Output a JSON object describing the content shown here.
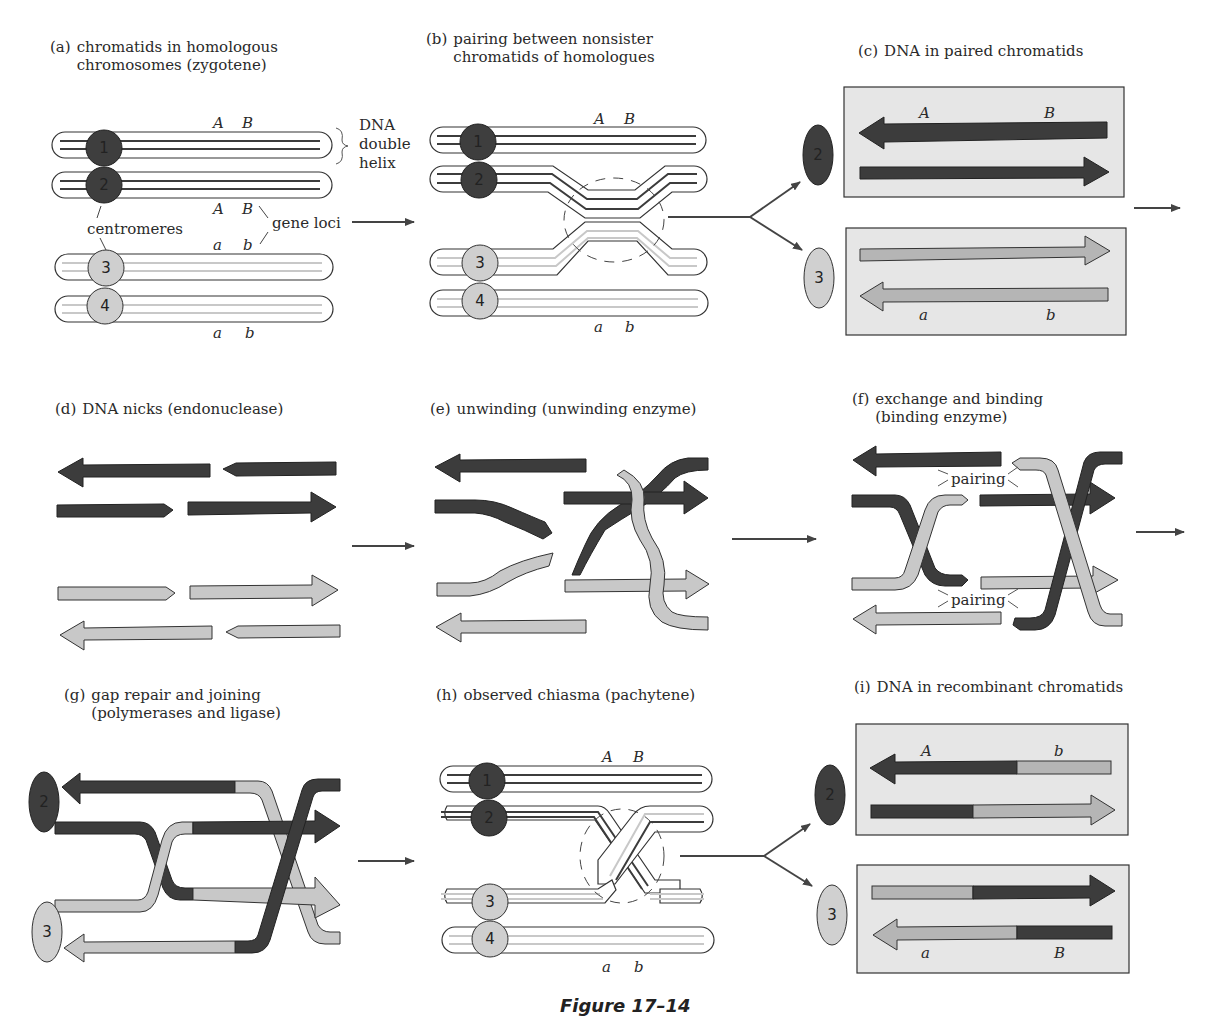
{
  "figure": {
    "title": "Figure 17–14",
    "colors": {
      "dark_strand": "#3c3c3c",
      "light_strand": "#c8c8c8",
      "box_fill": "#e6e6e6",
      "outline": "#333333"
    }
  },
  "panels": [
    {
      "id": "a",
      "tag": "(a)",
      "caption": "chromatids in homologous\nchromosomes (zygotene)"
    },
    {
      "id": "b",
      "tag": "(b)",
      "caption": "pairing between nonsister\nchromatids of homologues"
    },
    {
      "id": "c",
      "tag": "(c)",
      "caption": "DNA in paired chromatids"
    },
    {
      "id": "d",
      "tag": "(d)",
      "caption": "DNA nicks (endonuclease)"
    },
    {
      "id": "e",
      "tag": "(e)",
      "caption": "unwinding (unwinding enzyme)"
    },
    {
      "id": "f",
      "tag": "(f)",
      "caption": "exchange and binding\n(binding enzyme)"
    },
    {
      "id": "g",
      "tag": "(g)",
      "caption": "gap repair and joining\n(polymerases and ligase)"
    },
    {
      "id": "h",
      "tag": "(h)",
      "caption": "observed chiasma (pachytene)"
    },
    {
      "id": "i",
      "tag": "(i)",
      "caption": "DNA in recombinant chromatids"
    }
  ],
  "annotations": {
    "dna_double_helix": "DNA\ndouble\nhelix",
    "dna_l1": "DNA",
    "dna_l2": "double",
    "dna_l3": "helix",
    "centromeres": "centromeres",
    "gene_loci": "gene loci",
    "pairing": "pairing"
  },
  "loci": {
    "A": "A",
    "B": "B",
    "a": "a",
    "b": "b"
  },
  "chromatids": {
    "c1": "1",
    "c2": "2",
    "c3": "3",
    "c4": "4"
  }
}
